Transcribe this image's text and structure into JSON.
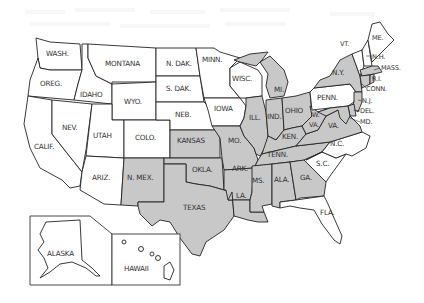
{
  "map": {
    "title": "United States",
    "colors": {
      "shaded": "#c8c8c8",
      "unshaded": "#ffffff",
      "border": "#222222",
      "label": "#333333"
    },
    "states": [
      {
        "id": "wash",
        "label": "WASH.",
        "shaded": false
      },
      {
        "id": "oreg",
        "label": "OREG.",
        "shaded": false
      },
      {
        "id": "calif",
        "label": "CALIF.",
        "shaded": false
      },
      {
        "id": "idaho",
        "label": "IDAHO",
        "shaded": false
      },
      {
        "id": "nev",
        "label": "NEV.",
        "shaded": false
      },
      {
        "id": "montana",
        "label": "MONTANA",
        "shaded": false
      },
      {
        "id": "wyo",
        "label": "WYO.",
        "shaded": false
      },
      {
        "id": "utah",
        "label": "UTAH",
        "shaded": false
      },
      {
        "id": "ariz",
        "label": "ARIZ.",
        "shaded": false
      },
      {
        "id": "colo",
        "label": "COLO.",
        "shaded": false
      },
      {
        "id": "nmex",
        "label": "N. MEX.",
        "shaded": true
      },
      {
        "id": "ndak",
        "label": "N. DAK.",
        "shaded": false
      },
      {
        "id": "sdak",
        "label": "S. DAK.",
        "shaded": false
      },
      {
        "id": "neb",
        "label": "NEB.",
        "shaded": false
      },
      {
        "id": "kansas",
        "label": "KANSAS",
        "shaded": true
      },
      {
        "id": "okla",
        "label": "OKLA.",
        "shaded": true
      },
      {
        "id": "texas",
        "label": "TEXAS",
        "shaded": true
      },
      {
        "id": "minn",
        "label": "MINN.",
        "shaded": false
      },
      {
        "id": "iowa",
        "label": "IOWA",
        "shaded": false
      },
      {
        "id": "mo",
        "label": "MO.",
        "shaded": true
      },
      {
        "id": "ark",
        "label": "ARK.",
        "shaded": true
      },
      {
        "id": "la",
        "label": "LA.",
        "shaded": true
      },
      {
        "id": "wisc",
        "label": "WISC.",
        "shaded": false
      },
      {
        "id": "ill",
        "label": "ILL.",
        "shaded": true
      },
      {
        "id": "mi",
        "label": "MI.",
        "shaded": true
      },
      {
        "id": "ind",
        "label": "IND.",
        "shaded": true
      },
      {
        "id": "ohio",
        "label": "OHIO",
        "shaded": true
      },
      {
        "id": "ken",
        "label": "KEN.",
        "shaded": true
      },
      {
        "id": "tenn",
        "label": "TENN.",
        "shaded": true
      },
      {
        "id": "ms",
        "label": "MS.",
        "shaded": true
      },
      {
        "id": "ala",
        "label": "ALA.",
        "shaded": true
      },
      {
        "id": "ga",
        "label": "GA.",
        "shaded": true
      },
      {
        "id": "fla",
        "label": "FLA.",
        "shaded": false
      },
      {
        "id": "sc",
        "label": "S.C.",
        "shaded": false
      },
      {
        "id": "nc",
        "label": "N.C.",
        "shaded": false
      },
      {
        "id": "va",
        "label": "VA.",
        "shaded": true
      },
      {
        "id": "wva",
        "label": "W. VA.",
        "shaded": true
      },
      {
        "id": "penn",
        "label": "PENN.",
        "shaded": false
      },
      {
        "id": "ny",
        "label": "N.Y.",
        "shaded": true
      },
      {
        "id": "vt",
        "label": "VT.",
        "shaded": false
      },
      {
        "id": "me",
        "label": "ME.",
        "shaded": false
      },
      {
        "id": "nh",
        "label": "N.H.",
        "shaded": false
      },
      {
        "id": "mass",
        "label": "MASS.",
        "shaded": true
      },
      {
        "id": "ri",
        "label": "R.I.",
        "shaded": true
      },
      {
        "id": "conn",
        "label": "CONN.",
        "shaded": true
      },
      {
        "id": "nj",
        "label": "N.J.",
        "shaded": true
      },
      {
        "id": "del",
        "label": "DEL.",
        "shaded": true
      },
      {
        "id": "md",
        "label": "MD.",
        "shaded": true
      },
      {
        "id": "alaska",
        "label": "ALASKA",
        "shaded": false
      },
      {
        "id": "hawaii",
        "label": "HAWAII",
        "shaded": false
      }
    ]
  }
}
